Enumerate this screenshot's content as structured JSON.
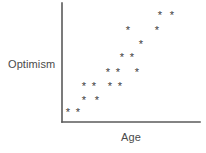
{
  "chart_data": {
    "type": "scatter",
    "title": "",
    "xlabel": "Age",
    "ylabel": "Optimism",
    "marker": "*",
    "marker_color": "#3c3c3c",
    "axis_color": "#5a5a5a",
    "background": "#ffffff",
    "grid": false,
    "legend": null,
    "xlim": [
      0,
      10
    ],
    "ylim": [
      0,
      10
    ],
    "tick_labels_x": [],
    "tick_labels_y": [],
    "points": [
      {
        "x": 0.45,
        "y": 0.75
      },
      {
        "x": 1.15,
        "y": 0.75
      },
      {
        "x": 1.6,
        "y": 1.75
      },
      {
        "x": 2.5,
        "y": 1.75
      },
      {
        "x": 1.6,
        "y": 2.95
      },
      {
        "x": 2.35,
        "y": 2.95
      },
      {
        "x": 3.5,
        "y": 2.95
      },
      {
        "x": 4.25,
        "y": 2.95
      },
      {
        "x": 3.35,
        "y": 4.1
      },
      {
        "x": 4.1,
        "y": 4.1
      },
      {
        "x": 5.5,
        "y": 4.1
      },
      {
        "x": 4.4,
        "y": 5.35
      },
      {
        "x": 5.15,
        "y": 5.35
      },
      {
        "x": 5.85,
        "y": 6.5
      },
      {
        "x": 4.85,
        "y": 7.75
      },
      {
        "x": 7.0,
        "y": 7.75
      },
      {
        "x": 7.2,
        "y": 8.9
      },
      {
        "x": 8.5,
        "y": 9.9
      }
    ],
    "axes": {
      "y_axis": {
        "x": 62,
        "y_top": 3,
        "y_bottom": 122
      },
      "x_axis": {
        "y": 122,
        "x_left": 62,
        "x_right": 200
      }
    },
    "markers_px": [
      {
        "cx": 68,
        "cy": 113
      },
      {
        "cx": 78,
        "cy": 113
      },
      {
        "cx": 84,
        "cy": 101
      },
      {
        "cx": 97,
        "cy": 101
      },
      {
        "cx": 84,
        "cy": 87
      },
      {
        "cx": 94,
        "cy": 87
      },
      {
        "cx": 110,
        "cy": 87
      },
      {
        "cx": 120,
        "cy": 87
      },
      {
        "cx": 108,
        "cy": 73
      },
      {
        "cx": 118,
        "cy": 73
      },
      {
        "cx": 137,
        "cy": 73
      },
      {
        "cx": 122,
        "cy": 58
      },
      {
        "cx": 132,
        "cy": 58
      },
      {
        "cx": 141,
        "cy": 45
      },
      {
        "cx": 128,
        "cy": 31
      },
      {
        "cx": 157,
        "cy": 31
      },
      {
        "cx": 160,
        "cy": 16
      },
      {
        "cx": 172,
        "cy": 16
      }
    ]
  }
}
